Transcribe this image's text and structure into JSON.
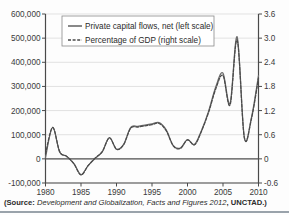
{
  "figure": {
    "source_note_lead": "(Source: ",
    "source_note_italic": "Development and Globalization, Facts and Figures 2012",
    "source_note_tail": ", UNCTAD.)"
  },
  "legend": {
    "position": "top-center",
    "items": [
      {
        "label": "Private capital flows, net (left scale)",
        "style": "solid",
        "color": "#6b6b6b"
      },
      {
        "label": "Percentage of GDP (right scale)",
        "style": "dashed",
        "color": "#4a4a4a"
      }
    ]
  },
  "chart_data": {
    "type": "line",
    "title": "",
    "xlabel": "",
    "ylabel": "",
    "grid": true,
    "x": [
      1980,
      1981,
      1982,
      1983,
      1984,
      1985,
      1986,
      1987,
      1988,
      1989,
      1990,
      1991,
      1992,
      1993,
      1994,
      1995,
      1996,
      1997,
      1998,
      1999,
      2000,
      2001,
      2002,
      2003,
      2004,
      2005,
      2006,
      2007,
      2008,
      2009,
      2010
    ],
    "xlim": [
      1980,
      2010
    ],
    "xticks": [
      1980,
      1985,
      1990,
      1995,
      2000,
      2005,
      2010
    ],
    "xticklabels": [
      "1980",
      "1985",
      "1990",
      "1995",
      "2000",
      "2005",
      "2010"
    ],
    "axes": [
      {
        "id": "left",
        "label": "",
        "ylim": [
          -100000,
          600000
        ],
        "yticks": [
          -100000,
          0,
          100000,
          200000,
          300000,
          400000,
          500000,
          600000
        ],
        "yticklabels": [
          "-100,000",
          "0",
          "100,000",
          "200,000",
          "300,000",
          "400,000",
          "500,000",
          "600,000"
        ]
      },
      {
        "id": "right",
        "label": "",
        "ylim": [
          -0.6,
          3.6
        ],
        "yticks": [
          -0.6,
          0,
          0.6,
          1.2,
          1.8,
          2.4,
          3.0,
          3.6
        ],
        "yticklabels": [
          "-0.6",
          "0",
          "0.6",
          "1.2",
          "1.8",
          "2.4",
          "3.0",
          "3.6"
        ]
      }
    ],
    "series": [
      {
        "name": "Private capital flows, net (left scale)",
        "axis": "left",
        "style": "solid",
        "color": "#6b6b6b",
        "values": [
          5000,
          130000,
          28000,
          10000,
          -20000,
          -65000,
          -28000,
          2000,
          30000,
          88000,
          40000,
          60000,
          130000,
          135000,
          140000,
          145000,
          150000,
          120000,
          55000,
          45000,
          80000,
          60000,
          120000,
          200000,
          300000,
          355000,
          230000,
          505000,
          90000,
          170000,
          345000
        ]
      },
      {
        "name": "Percentage of GDP (right scale)",
        "axis": "right",
        "style": "dashed",
        "color": "#4a4a4a",
        "values": [
          0.12,
          0.78,
          0.18,
          0.06,
          -0.12,
          -0.4,
          -0.17,
          0.02,
          0.18,
          0.52,
          0.24,
          0.35,
          0.76,
          0.79,
          0.82,
          0.85,
          0.88,
          0.7,
          0.32,
          0.26,
          0.47,
          0.35,
          0.7,
          1.17,
          1.75,
          2.07,
          1.34,
          2.95,
          0.53,
          0.99,
          2.01
        ]
      }
    ],
    "annotations": []
  }
}
